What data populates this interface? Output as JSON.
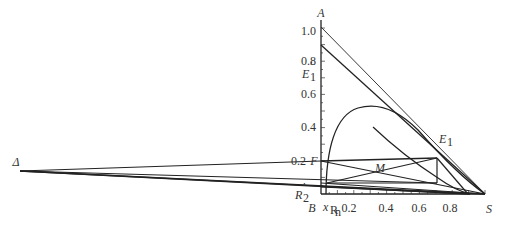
{
  "diagram": {
    "y_ticks": [
      "1.0",
      "0.8",
      "0.6",
      "0.4",
      "0.2"
    ],
    "x_ticks": [
      "0.2",
      "0.4",
      "0.6",
      "0.8"
    ],
    "point_labels": {
      "A": "A",
      "B": "B",
      "S": "S",
      "F": "F",
      "M": "M",
      "E1": "E",
      "E1_sub": "1",
      "E1p": "E",
      "E1p_sub": "1",
      "E1p_prime": "′",
      "R2p": "R",
      "R2p_sub": "2",
      "R2p_prime": "′",
      "delta": "Δ",
      "xRn": "x",
      "xRn_sub": "R",
      "xRn_subsub": "n"
    },
    "points": {
      "A": [
        0,
        1.0
      ],
      "B": [
        0,
        0
      ],
      "S": [
        1.0,
        0
      ],
      "F": [
        0,
        0.2
      ],
      "E1p": [
        0,
        0.73
      ],
      "E1": [
        0.72,
        0.22
      ],
      "M": [
        0.36,
        0.16
      ],
      "R2p": [
        0,
        0.05
      ],
      "xRn": [
        0.06,
        0
      ],
      "delta": [
        -4.2,
        0.1
      ]
    }
  }
}
